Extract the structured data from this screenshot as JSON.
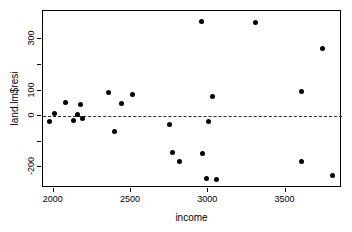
{
  "chart_data": {
    "type": "scatter",
    "title": "",
    "xlabel": "income",
    "ylabel": "land.lm$resi",
    "xlim": [
      1930,
      3865
    ],
    "ylim": [
      -280,
      410
    ],
    "xticks": [
      2000,
      2500,
      3000,
      3500
    ],
    "yticks": [
      -200,
      0,
      100,
      300
    ],
    "ytick_labels": [
      "-200",
      "0",
      "100",
      "300"
    ],
    "xtick_labels": [
      "2000",
      "2500",
      "3000",
      "3500"
    ],
    "grid": false,
    "legend": "none",
    "reference_line": {
      "orientation": "horizontal",
      "y": 0,
      "style": "dashed"
    },
    "points": [
      {
        "x": 1975,
        "y": -20
      },
      {
        "x": 2005,
        "y": 10
      },
      {
        "x": 2075,
        "y": 55
      },
      {
        "x": 2130,
        "y": -15
      },
      {
        "x": 2155,
        "y": 8
      },
      {
        "x": 2175,
        "y": 45
      },
      {
        "x": 2185,
        "y": -8
      },
      {
        "x": 2355,
        "y": 93
      },
      {
        "x": 2395,
        "y": -58
      },
      {
        "x": 2435,
        "y": 48
      },
      {
        "x": 2510,
        "y": 83
      },
      {
        "x": 2750,
        "y": -33
      },
      {
        "x": 2765,
        "y": -142
      },
      {
        "x": 2815,
        "y": -178
      },
      {
        "x": 2955,
        "y": 368
      },
      {
        "x": 2960,
        "y": -145
      },
      {
        "x": 2985,
        "y": -243
      },
      {
        "x": 3000,
        "y": -20
      },
      {
        "x": 3030,
        "y": 78
      },
      {
        "x": 3050,
        "y": -247
      },
      {
        "x": 3305,
        "y": 365
      },
      {
        "x": 3600,
        "y": 98
      },
      {
        "x": 3605,
        "y": -178
      },
      {
        "x": 3740,
        "y": 262
      },
      {
        "x": 3805,
        "y": -232
      }
    ]
  },
  "figure": {
    "background_color": "#ffffff",
    "point_color": "#000000",
    "axis_color": "#000000"
  }
}
